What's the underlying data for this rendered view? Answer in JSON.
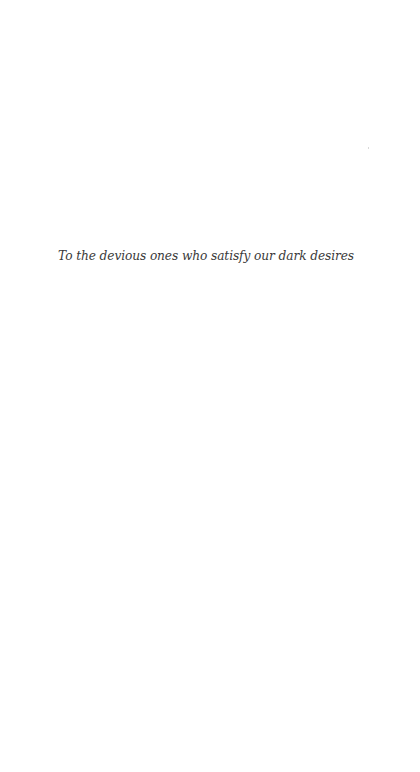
{
  "page": {
    "dedication": "To the devious ones who satisfy our dark desires"
  }
}
